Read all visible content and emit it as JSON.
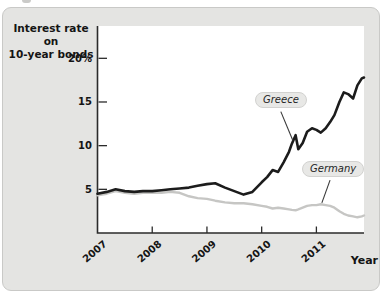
{
  "figure": {
    "panel_bg": "#e4e4e2",
    "plot_bg": "#ffffff",
    "axis_color": "#2b2b2b",
    "text_color": "#141414",
    "pill_bg": "#e8e8e6",
    "pill_border": "#d2d2d0",
    "callout_color": "#3a3a3a"
  },
  "chart_data": {
    "type": "line",
    "title_lines": [
      "Interest rate on",
      "10-year bonds"
    ],
    "ylabel": "Interest rate on 10-year bonds",
    "xlabel": "Year",
    "xlim": [
      2007,
      2011.87
    ],
    "ylim": [
      0,
      23.7
    ],
    "grid": false,
    "legend": "inline callout labels",
    "y_ticks": [
      {
        "value": 5,
        "label": "5"
      },
      {
        "value": 10,
        "label": "10"
      },
      {
        "value": 15,
        "label": "15"
      },
      {
        "value": 20,
        "label": "20%"
      }
    ],
    "x_ticks": [
      {
        "value": 2007,
        "label": "2007"
      },
      {
        "value": 2008,
        "label": "2008"
      },
      {
        "value": 2009,
        "label": "2009"
      },
      {
        "value": 2010,
        "label": "2010"
      },
      {
        "value": 2011,
        "label": "2011"
      }
    ],
    "x": [
      2007.0,
      2007.17,
      2007.33,
      2007.5,
      2007.67,
      2007.83,
      2008.0,
      2008.17,
      2008.33,
      2008.5,
      2008.67,
      2008.83,
      2009.0,
      2009.15,
      2009.33,
      2009.5,
      2009.67,
      2009.83,
      2010.0,
      2010.1,
      2010.2,
      2010.3,
      2010.4,
      2010.5,
      2010.55,
      2010.62,
      2010.67,
      2010.75,
      2010.83,
      2010.92,
      2011.0,
      2011.08,
      2011.17,
      2011.25,
      2011.33,
      2011.42,
      2011.5,
      2011.58,
      2011.67,
      2011.75,
      2011.83,
      2011.87
    ],
    "series": [
      {
        "name": "Greece",
        "color": "#1c1c1c",
        "width": 2.6,
        "values": [
          4.5,
          4.7,
          5.0,
          4.8,
          4.7,
          4.8,
          4.8,
          4.9,
          5.0,
          5.1,
          5.2,
          5.4,
          5.6,
          5.7,
          5.2,
          4.8,
          4.4,
          4.7,
          5.8,
          6.4,
          7.2,
          7.0,
          8.1,
          9.3,
          10.2,
          11.2,
          9.6,
          10.3,
          11.6,
          12.0,
          11.8,
          11.5,
          12.0,
          12.7,
          13.5,
          15.0,
          16.1,
          15.9,
          15.4,
          16.9,
          17.7,
          17.8
        ]
      },
      {
        "name": "Germany",
        "color": "#c6c6c4",
        "width": 2.4,
        "values": [
          4.3,
          4.5,
          4.8,
          4.6,
          4.5,
          4.6,
          4.6,
          4.6,
          4.7,
          4.6,
          4.2,
          4.0,
          3.9,
          3.7,
          3.5,
          3.4,
          3.4,
          3.3,
          3.1,
          3.0,
          2.8,
          2.9,
          2.8,
          2.7,
          2.65,
          2.6,
          2.7,
          2.9,
          3.1,
          3.2,
          3.2,
          3.3,
          3.2,
          3.1,
          2.9,
          2.5,
          2.2,
          2.0,
          1.9,
          1.8,
          1.9,
          2.0
        ]
      }
    ],
    "annotations": [
      {
        "label": "Greece",
        "line_from": [
          2010.35,
          13.9
        ],
        "line_to": [
          2010.57,
          10.6
        ]
      },
      {
        "label": "Germany",
        "line_from": [
          2011.25,
          6.05
        ],
        "line_to": [
          2011.1,
          3.45
        ]
      }
    ]
  }
}
